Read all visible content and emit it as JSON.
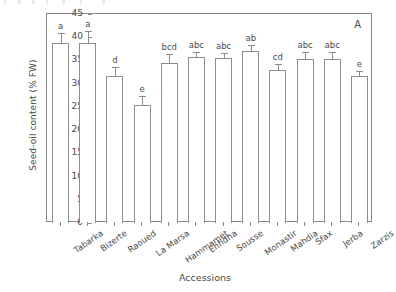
{
  "chart_data": {
    "type": "bar",
    "title": "",
    "panel_label": "A",
    "xlabel": "Accessions",
    "ylabel": "Seed-oil content (% FW)",
    "ylim": [
      0,
      45
    ],
    "yticks": [
      0,
      5,
      10,
      15,
      20,
      25,
      30,
      35,
      40,
      45
    ],
    "ytick_labels": [
      "0",
      "5",
      "10",
      "15",
      "20",
      "25",
      "30",
      "35",
      "40",
      "45"
    ],
    "grid": false,
    "legend": null,
    "error_bars": "upper only (SE)",
    "categories": [
      "Tabarka",
      "Bizerte",
      "Raoued",
      "La Marsa",
      "Hammamet",
      "Enfidha",
      "Sousse",
      "Monastir",
      "Mahdia",
      "Sfax",
      "Jerba",
      "Zarzis"
    ],
    "values": [
      38.8,
      38.7,
      31.6,
      25.4,
      34.4,
      35.7,
      35.5,
      37.0,
      33.0,
      35.4,
      35.4,
      31.7
    ],
    "errors": [
      2.1,
      2.6,
      2.0,
      1.9,
      1.9,
      1.1,
      1.2,
      1.4,
      1.3,
      1.5,
      1.4,
      1.0
    ],
    "annotations": [
      "a",
      "a",
      "d",
      "e",
      "bcd",
      "abc",
      "abc",
      "ab",
      "cd",
      "abc",
      "abc",
      "e"
    ],
    "bar_facecolor": "#ffffff",
    "bar_edgecolor": "#8d8d8d",
    "axis_color": "#8a8a8a",
    "text_color": "#4a4a4a"
  }
}
